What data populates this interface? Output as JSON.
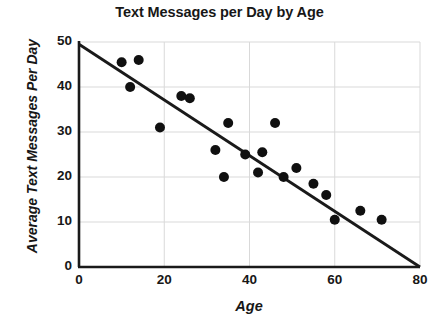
{
  "chart_data": {
    "type": "scatter",
    "title": "Text Messages per Day by Age",
    "xlabel": "Age",
    "ylabel": "Average Text Messages Per Day",
    "xlim": [
      0,
      80
    ],
    "ylim": [
      0,
      50
    ],
    "xticks": [
      0,
      20,
      40,
      60,
      80
    ],
    "yticks": [
      0,
      10,
      20,
      30,
      40,
      50
    ],
    "grid": true,
    "grid_color": "#d9d9d9",
    "legend": null,
    "marker_color": "#101010",
    "trendline_color": "#1a1a1a",
    "points": [
      {
        "x": 10,
        "y": 45.5
      },
      {
        "x": 14,
        "y": 46
      },
      {
        "x": 12,
        "y": 40
      },
      {
        "x": 19,
        "y": 31
      },
      {
        "x": 24,
        "y": 38
      },
      {
        "x": 26,
        "y": 37.5
      },
      {
        "x": 35,
        "y": 32
      },
      {
        "x": 46,
        "y": 32
      },
      {
        "x": 32,
        "y": 26
      },
      {
        "x": 39,
        "y": 25
      },
      {
        "x": 43,
        "y": 25.5
      },
      {
        "x": 34,
        "y": 20
      },
      {
        "x": 42,
        "y": 21
      },
      {
        "x": 48,
        "y": 20
      },
      {
        "x": 51,
        "y": 22
      },
      {
        "x": 55,
        "y": 18.5
      },
      {
        "x": 58,
        "y": 16
      },
      {
        "x": 60,
        "y": 10.5
      },
      {
        "x": 66,
        "y": 12.5
      },
      {
        "x": 71,
        "y": 10.5
      }
    ],
    "trendline": {
      "x": [
        0,
        80
      ],
      "y": [
        49.5,
        0
      ],
      "intercept": 49.5,
      "slope": -0.619
    }
  }
}
